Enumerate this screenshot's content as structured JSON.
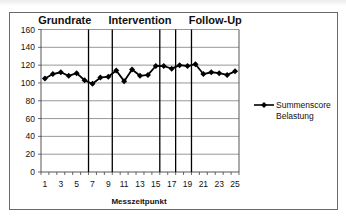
{
  "chart_data": {
    "type": "line",
    "title": "",
    "xlabel": "Messzeitpunkt",
    "ylabel": "",
    "ylim": [
      0,
      160
    ],
    "yticks": [
      0,
      20,
      40,
      60,
      80,
      100,
      120,
      140,
      160
    ],
    "xticks_labeled": [
      1,
      3,
      5,
      7,
      9,
      11,
      13,
      15,
      17,
      19,
      21,
      23,
      25
    ],
    "x": [
      1,
      2,
      3,
      4,
      5,
      6,
      7,
      8,
      9,
      10,
      11,
      12,
      13,
      14,
      15,
      16,
      17,
      18,
      19,
      20,
      21,
      22,
      23,
      24,
      25
    ],
    "series": [
      {
        "name": "Summenscore Belastung",
        "values": [
          105,
          110,
          112,
          108,
          111,
          103,
          99,
          106,
          107,
          114,
          102,
          115,
          108,
          109,
          119,
          119,
          116,
          120,
          119,
          121,
          110,
          112,
          111,
          109,
          113
        ]
      }
    ],
    "phase_labels": [
      {
        "label": "Grundrate",
        "center_x": 3.5
      },
      {
        "label": "Intervention",
        "center_x": 13
      },
      {
        "label": "Follow-Up",
        "center_x": 22.5
      }
    ],
    "phase_dividers_x": [
      6.5,
      9.5,
      15.5,
      17.5,
      19.5
    ],
    "grid": true,
    "legend_position": "right",
    "legend": [
      "Summenscore",
      "Belastung"
    ],
    "colors": {
      "line": "#000000",
      "grid": "#7f7f7f",
      "frame": "#6a6a6a"
    }
  }
}
